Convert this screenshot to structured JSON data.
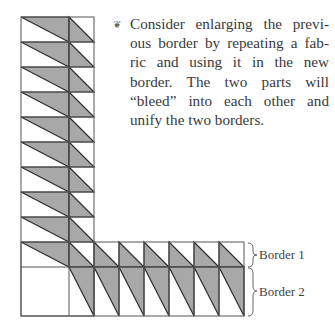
{
  "tip": {
    "ornament_icon": "❦",
    "lines": [
      "Consider enlarging the previ-",
      "ous border by repeating a fab-",
      "ric and using it in the new",
      "border. The two parts will",
      "“bleed” into each other and",
      "unify the two borders."
    ]
  },
  "labels": {
    "border1": "Border 1",
    "border2": "Border 2"
  },
  "colors": {
    "fill": "#a8a8a8",
    "line": "#2e2e2e",
    "grid_light": "#9a9a9a"
  }
}
